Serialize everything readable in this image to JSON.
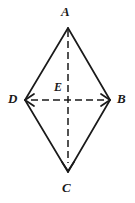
{
  "figure": {
    "type": "geometry-diagram",
    "shape": "rhombus",
    "background_color": "#ffffff",
    "stroke_color": "#1a1a1a",
    "canvas": {
      "width": 135,
      "height": 203
    },
    "vertices": [
      {
        "id": "A",
        "label": "A",
        "x": 68,
        "y": 28,
        "position": "top"
      },
      {
        "id": "B",
        "label": "B",
        "x": 110,
        "y": 100,
        "position": "right"
      },
      {
        "id": "C",
        "label": "C",
        "x": 68,
        "y": 172,
        "position": "bottom"
      },
      {
        "id": "D",
        "label": "D",
        "x": 25,
        "y": 100,
        "position": "left"
      },
      {
        "id": "E",
        "label": "E",
        "x": 68,
        "y": 100,
        "position": "center"
      }
    ],
    "edges": [
      {
        "from": "A",
        "to": "B",
        "style": "solid"
      },
      {
        "from": "B",
        "to": "C",
        "style": "solid"
      },
      {
        "from": "C",
        "to": "D",
        "style": "solid"
      },
      {
        "from": "D",
        "to": "A",
        "style": "solid"
      }
    ],
    "diagonals": [
      {
        "from": "A",
        "to": "C",
        "style": "dashed",
        "arrow_at": "C",
        "orientation": "vertical"
      },
      {
        "from": "D",
        "to": "B",
        "style": "dashed",
        "arrow_at": "both",
        "orientation": "horizontal"
      }
    ],
    "dash_pattern": "7 4",
    "stroke_width": 1.6,
    "labels": {
      "A": "A",
      "B": "B",
      "C": "C",
      "D": "D",
      "E": "E"
    }
  }
}
